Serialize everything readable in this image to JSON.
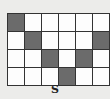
{
  "figure": {
    "label": "S",
    "rows": 4,
    "cols": 6,
    "shaded_color": "#6b6b6b",
    "empty_color": "#fdfdfd",
    "cells": [
      [
        1,
        0,
        0,
        0,
        0,
        0
      ],
      [
        0,
        1,
        0,
        0,
        0,
        1
      ],
      [
        0,
        0,
        1,
        0,
        1,
        0
      ],
      [
        0,
        0,
        0,
        1,
        0,
        0
      ]
    ]
  }
}
